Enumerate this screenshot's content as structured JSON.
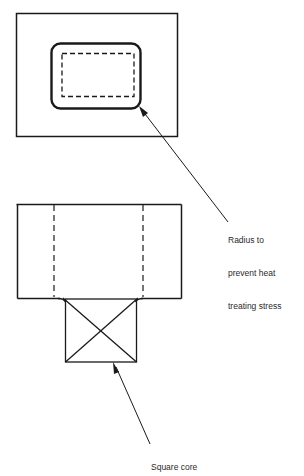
{
  "diagram": {
    "type": "technical-drawing",
    "views": [
      {
        "name": "top-view",
        "elements": [
          "outer-rectangle",
          "rounded-cavity",
          "dashed-hidden-outline"
        ]
      },
      {
        "name": "front-view",
        "elements": [
          "body-rectangle",
          "hidden-line-left",
          "hidden-line-right",
          "square-core-with-cross"
        ]
      }
    ],
    "callouts": [
      {
        "id": "radius",
        "lines": [
          "Radius to",
          "prevent heat",
          "treating stress"
        ]
      },
      {
        "id": "square-core",
        "lines": [
          "Square core"
        ]
      }
    ],
    "colors": {
      "line": "#1a1a1a",
      "text": "#2a2a2a",
      "background": "#ffffff"
    }
  }
}
